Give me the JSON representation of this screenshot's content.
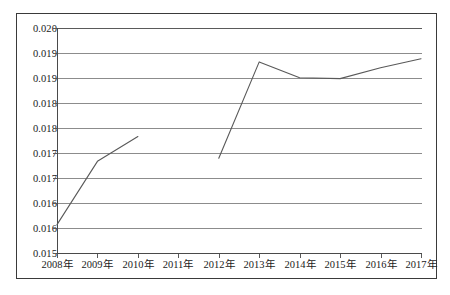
{
  "chart_data": {
    "type": "line",
    "title": "",
    "subtitle": "",
    "xlabel": "",
    "ylabel": "",
    "categories": [
      "2008年",
      "2009年",
      "2010年",
      "2011年",
      "2012年",
      "2013年",
      "2014年",
      "2015年",
      "2016年",
      "2017年"
    ],
    "series": [
      {
        "name": "",
        "values": [
          0.01565,
          0.01705,
          0.0176,
          null,
          0.01712,
          0.01925,
          0.0189,
          0.01888,
          0.01912,
          0.01932
        ],
        "color": "#595959"
      }
    ],
    "ylim": [
      0.015,
      0.02
    ],
    "ytick_values": [
      0.015,
      0.0155,
      0.016,
      0.0165,
      0.017,
      0.0175,
      0.018,
      0.0185,
      0.019,
      0.0195,
      0.02
    ],
    "ytick_labels": [
      "0.015",
      "0.016",
      "0.016",
      "0.017",
      "0.017",
      "0.018",
      "0.018",
      "0.019",
      "0.019",
      "0.020"
    ],
    "ytick_labels_top_to_bottom": [
      "0.020",
      "0.019",
      "0.019",
      "0.018",
      "0.018",
      "0.017",
      "0.017",
      "0.016",
      "0.016",
      "0.015"
    ],
    "grid": true,
    "grid_orientation": "horizontal",
    "legend": false,
    "legend_position": "none",
    "annotations": [],
    "line_color": "#595959",
    "grid_color": "#8c8c8c",
    "frame_color": "#3a3a3a"
  },
  "figure": {
    "background": "#ffffff",
    "border_color": "#3a3a3a"
  }
}
